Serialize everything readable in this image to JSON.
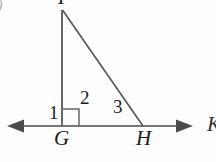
{
  "figure": {
    "background_color": "#fdfdfd",
    "stroke_color": "#555555",
    "text_color": "#1b1b1b"
  },
  "item_marker": ")",
  "labels": {
    "angle_1": "1",
    "angle_2": "2",
    "angle_3": "3",
    "vertex_g": "G",
    "vertex_h": "H",
    "vertex_apex": "F",
    "right_edge_partial": "K"
  },
  "geometry": {
    "baseline": {
      "x1": 8,
      "y1": 126,
      "x2": 192,
      "y2": 126,
      "arrows": "both"
    },
    "vertical_leg": {
      "x1": 62,
      "y1": 10,
      "x2": 62,
      "y2": 126
    },
    "hypotenuse": {
      "x1": 62,
      "y1": 10,
      "x2": 143,
      "y2": 126
    },
    "right_angle_marker": {
      "x": 62,
      "y": 109,
      "size": 17
    },
    "points": {
      "G": {
        "x": 62,
        "y": 126
      },
      "H": {
        "x": 143,
        "y": 126
      },
      "apex": {
        "x": 62,
        "y": 10
      }
    }
  }
}
